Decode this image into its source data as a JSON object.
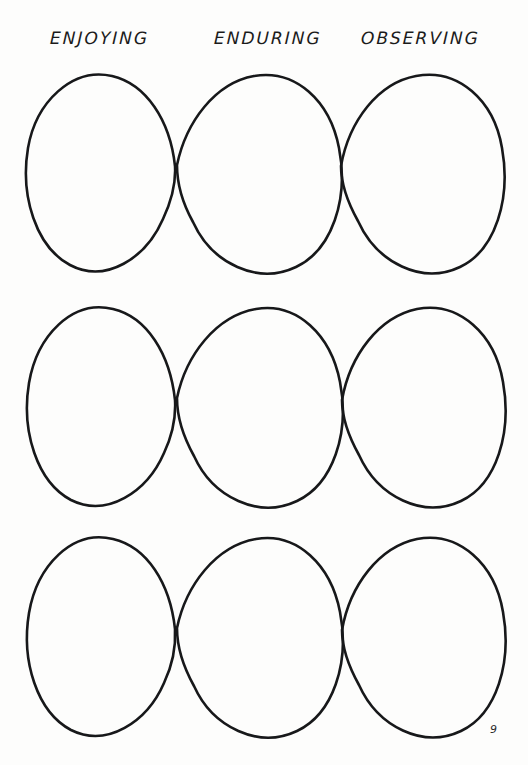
{
  "page": {
    "number": "9",
    "background_color": "#fdfdfc",
    "ink_color": "#17181a",
    "width": 528,
    "height": 765
  },
  "columns": [
    {
      "label": "ENJOYING"
    },
    {
      "label": "ENDURING"
    },
    {
      "label": "OBSERVING"
    }
  ],
  "grid": {
    "rows": 3,
    "columns": 3,
    "shape": "hand-drawn-oval",
    "description": "three rows of three interlocking hand-drawn ovals that cross at their shared edges",
    "row_tops": [
      74,
      302,
      532
    ],
    "row_bottoms": [
      272,
      508,
      740
    ],
    "crossing_x": [
      177,
      343
    ],
    "row_crossing_y": [
      166,
      398,
      628
    ]
  },
  "ovals": [
    {
      "row": 1,
      "col": 1,
      "d": "M 175 166 C 170 120 146 84 112 76 C 72 67 36 102 28 148 C 20 196 36 247 70 265 C 106 284 146 258 163 219 C 172 200 176 183 175 166 Z"
    },
    {
      "row": 1,
      "col": 2,
      "d": "M 177 165 C 186 122 215 83 254 76 C 296 69 330 101 339 148 C 349 199 332 250 296 267 C 258 285 212 264 193 222 C 183 204 177 184 177 165 Z"
    },
    {
      "row": 1,
      "col": 3,
      "d": "M 341 166 C 349 121 378 83 416 76 C 458 68 494 100 502 148 C 511 198 496 250 460 267 C 422 285 377 263 358 221 C 348 203 341 184 341 166 Z"
    },
    {
      "row": 2,
      "col": 1,
      "d": "M 175 400 C 170 354 147 317 113 309 C 72 299 37 336 29 383 C 21 431 37 482 71 500 C 107 518 147 492 164 453 C 173 434 176 417 175 400 Z"
    },
    {
      "row": 2,
      "col": 2,
      "d": "M 177 398 C 186 355 216 316 256 309 C 297 302 331 335 340 382 C 350 433 333 484 297 501 C 259 519 213 498 194 456 C 184 438 177 417 177 398 Z"
    },
    {
      "row": 2,
      "col": 3,
      "d": "M 342 400 C 350 355 379 317 417 309 C 459 301 495 334 503 382 C 512 432 497 484 461 501 C 423 519 378 497 359 455 C 349 437 342 418 342 400 Z"
    },
    {
      "row": 3,
      "col": 1,
      "d": "M 175 629 C 170 583 147 547 113 539 C 72 529 37 566 29 613 C 21 661 37 712 71 730 C 107 748 147 722 164 683 C 173 664 176 647 175 629 Z"
    },
    {
      "row": 3,
      "col": 2,
      "d": "M 177 628 C 186 585 216 546 256 539 C 297 532 331 565 340 612 C 350 663 333 714 297 731 C 259 749 213 728 194 686 C 184 668 177 647 177 628 Z"
    },
    {
      "row": 3,
      "col": 3,
      "d": "M 342 630 C 350 585 379 547 417 539 C 459 531 495 564 503 612 C 512 662 497 714 461 731 C 423 749 378 727 359 685 C 349 667 342 648 342 630 Z"
    }
  ]
}
